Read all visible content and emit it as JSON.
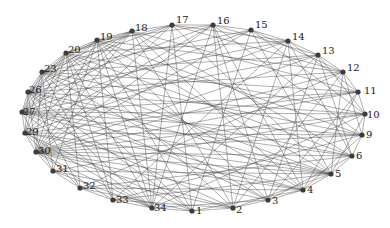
{
  "diagram": {
    "type": "circular-network-graph",
    "nodes": [
      {
        "id": "17",
        "x": 172,
        "y": 25,
        "lx": 4,
        "ly": -2
      },
      {
        "id": "16",
        "x": 213,
        "y": 25,
        "lx": 4,
        "ly": -1
      },
      {
        "id": "15",
        "x": 251,
        "y": 30,
        "lx": 4,
        "ly": -2
      },
      {
        "id": "14",
        "x": 288,
        "y": 41,
        "lx": 4,
        "ly": -1
      },
      {
        "id": "13",
        "x": 318,
        "y": 55,
        "lx": 4,
        "ly": -1
      },
      {
        "id": "12",
        "x": 343,
        "y": 72,
        "lx": 4,
        "ly": -1
      },
      {
        "id": "11",
        "x": 358,
        "y": 92,
        "lx": 6,
        "ly": 2
      },
      {
        "id": "10",
        "x": 365,
        "y": 114,
        "lx": 2,
        "ly": 4
      },
      {
        "id": "9",
        "x": 362,
        "y": 135,
        "lx": 4,
        "ly": 3
      },
      {
        "id": "6",
        "x": 352,
        "y": 156,
        "lx": 4,
        "ly": 3
      },
      {
        "id": "5",
        "x": 331,
        "y": 174,
        "lx": 4,
        "ly": 3
      },
      {
        "id": "4",
        "x": 303,
        "y": 190,
        "lx": 4,
        "ly": 3
      },
      {
        "id": "3",
        "x": 268,
        "y": 200,
        "lx": 4,
        "ly": 4
      },
      {
        "id": "2",
        "x": 233,
        "y": 208,
        "lx": 3,
        "ly": 5
      },
      {
        "id": "1",
        "x": 192,
        "y": 211,
        "lx": 4,
        "ly": 3
      },
      {
        "id": "34",
        "x": 152,
        "y": 208,
        "lx": 2,
        "ly": 3
      },
      {
        "id": "33",
        "x": 113,
        "y": 200,
        "lx": 3,
        "ly": 3
      },
      {
        "id": "32",
        "x": 80,
        "y": 188,
        "lx": 3,
        "ly": 1
      },
      {
        "id": "31",
        "x": 53,
        "y": 171,
        "lx": 3,
        "ly": 1
      },
      {
        "id": "30",
        "x": 36,
        "y": 152,
        "lx": 2,
        "ly": 2
      },
      {
        "id": "29",
        "x": 25,
        "y": 133,
        "lx": 1,
        "ly": 2
      },
      {
        "id": "27",
        "x": 22,
        "y": 112,
        "lx": 1,
        "ly": 3
      },
      {
        "id": "26",
        "x": 28,
        "y": 92,
        "lx": 1,
        "ly": 1
      },
      {
        "id": "23",
        "x": 42,
        "y": 72,
        "lx": 2,
        "ly": 0
      },
      {
        "id": "20",
        "x": 66,
        "y": 53,
        "lx": 2,
        "ly": 0
      },
      {
        "id": "19",
        "x": 97,
        "y": 40,
        "lx": 3,
        "ly": 0
      },
      {
        "id": "18",
        "x": 132,
        "y": 31,
        "lx": 3,
        "ly": 0
      }
    ],
    "edges": [
      [
        "17",
        "16"
      ],
      [
        "16",
        "15"
      ],
      [
        "15",
        "14"
      ],
      [
        "14",
        "13"
      ],
      [
        "13",
        "12"
      ],
      [
        "12",
        "11"
      ],
      [
        "11",
        "10"
      ],
      [
        "10",
        "9"
      ],
      [
        "9",
        "6"
      ],
      [
        "6",
        "5"
      ],
      [
        "5",
        "4"
      ],
      [
        "4",
        "3"
      ],
      [
        "3",
        "2"
      ],
      [
        "2",
        "1"
      ],
      [
        "1",
        "34"
      ],
      [
        "34",
        "33"
      ],
      [
        "33",
        "32"
      ],
      [
        "32",
        "31"
      ],
      [
        "31",
        "30"
      ],
      [
        "30",
        "29"
      ],
      [
        "29",
        "27"
      ],
      [
        "27",
        "26"
      ],
      [
        "26",
        "23"
      ],
      [
        "23",
        "20"
      ],
      [
        "20",
        "19"
      ],
      [
        "19",
        "18"
      ],
      [
        "18",
        "17"
      ],
      [
        "17",
        "14"
      ],
      [
        "17",
        "12"
      ],
      [
        "17",
        "5"
      ],
      [
        "17",
        "34"
      ],
      [
        "17",
        "30"
      ],
      [
        "17",
        "23"
      ],
      [
        "17",
        "20"
      ],
      [
        "17",
        "1"
      ],
      [
        "17",
        "27"
      ],
      [
        "16",
        "13"
      ],
      [
        "16",
        "4"
      ],
      [
        "16",
        "2"
      ],
      [
        "16",
        "34"
      ],
      [
        "16",
        "30"
      ],
      [
        "16",
        "26"
      ],
      [
        "16",
        "19"
      ],
      [
        "16",
        "9"
      ],
      [
        "16",
        "3"
      ],
      [
        "16",
        "29"
      ],
      [
        "15",
        "12"
      ],
      [
        "15",
        "10"
      ],
      [
        "15",
        "30"
      ],
      [
        "15",
        "23"
      ],
      [
        "15",
        "27"
      ],
      [
        "15",
        "5"
      ],
      [
        "15",
        "1"
      ],
      [
        "14",
        "11"
      ],
      [
        "14",
        "4"
      ],
      [
        "14",
        "2"
      ],
      [
        "14",
        "29"
      ],
      [
        "14",
        "20"
      ],
      [
        "14",
        "26"
      ],
      [
        "14",
        "6"
      ],
      [
        "14",
        "33"
      ],
      [
        "13",
        "10"
      ],
      [
        "13",
        "6"
      ],
      [
        "13",
        "3"
      ],
      [
        "13",
        "30"
      ],
      [
        "13",
        "23"
      ],
      [
        "13",
        "27"
      ],
      [
        "13",
        "34"
      ],
      [
        "12",
        "9"
      ],
      [
        "12",
        "5"
      ],
      [
        "12",
        "32"
      ],
      [
        "12",
        "26"
      ],
      [
        "12",
        "19"
      ],
      [
        "12",
        "30"
      ],
      [
        "12",
        "2"
      ],
      [
        "11",
        "30"
      ],
      [
        "11",
        "29"
      ],
      [
        "11",
        "23"
      ],
      [
        "11",
        "4"
      ],
      [
        "11",
        "3"
      ],
      [
        "11",
        "27"
      ],
      [
        "11",
        "18"
      ],
      [
        "10",
        "30"
      ],
      [
        "10",
        "27"
      ],
      [
        "10",
        "26"
      ],
      [
        "10",
        "20"
      ],
      [
        "10",
        "34"
      ],
      [
        "10",
        "5"
      ],
      [
        "10",
        "31"
      ],
      [
        "9",
        "30"
      ],
      [
        "9",
        "29"
      ],
      [
        "9",
        "23"
      ],
      [
        "9",
        "19"
      ],
      [
        "9",
        "33"
      ],
      [
        "9",
        "4"
      ],
      [
        "9",
        "27"
      ],
      [
        "6",
        "30"
      ],
      [
        "6",
        "27"
      ],
      [
        "6",
        "20"
      ],
      [
        "6",
        "18"
      ],
      [
        "6",
        "32"
      ],
      [
        "6",
        "3"
      ],
      [
        "6",
        "26"
      ],
      [
        "5",
        "30"
      ],
      [
        "5",
        "29"
      ],
      [
        "5",
        "23"
      ],
      [
        "5",
        "26"
      ],
      [
        "5",
        "19"
      ],
      [
        "5",
        "33"
      ],
      [
        "5",
        "2"
      ],
      [
        "5",
        "27"
      ],
      [
        "5",
        "31"
      ],
      [
        "4",
        "29"
      ],
      [
        "4",
        "27"
      ],
      [
        "4",
        "20"
      ],
      [
        "4",
        "18"
      ],
      [
        "4",
        "32"
      ],
      [
        "4",
        "1"
      ],
      [
        "4",
        "30"
      ],
      [
        "3",
        "30"
      ],
      [
        "3",
        "26"
      ],
      [
        "3",
        "19"
      ],
      [
        "3",
        "23"
      ],
      [
        "3",
        "34"
      ],
      [
        "2",
        "30"
      ],
      [
        "2",
        "27"
      ],
      [
        "2",
        "20"
      ],
      [
        "2",
        "18"
      ],
      [
        "2",
        "31"
      ],
      [
        "2",
        "33"
      ],
      [
        "1",
        "29"
      ],
      [
        "1",
        "23"
      ],
      [
        "1",
        "19"
      ],
      [
        "1",
        "26"
      ],
      [
        "1",
        "32"
      ],
      [
        "34",
        "18"
      ],
      [
        "34",
        "20"
      ],
      [
        "34",
        "26"
      ],
      [
        "34",
        "19"
      ],
      [
        "34",
        "31"
      ],
      [
        "34",
        "30"
      ],
      [
        "34",
        "29"
      ],
      [
        "34",
        "27"
      ],
      [
        "33",
        "23"
      ],
      [
        "33",
        "30"
      ],
      [
        "33",
        "19"
      ],
      [
        "33",
        "20"
      ],
      [
        "32",
        "29"
      ],
      [
        "32",
        "26"
      ],
      [
        "32",
        "20"
      ],
      [
        "31",
        "27"
      ],
      [
        "31",
        "23"
      ],
      [
        "31",
        "19"
      ],
      [
        "30",
        "26"
      ],
      [
        "30",
        "23"
      ],
      [
        "30",
        "20"
      ],
      [
        "30",
        "19"
      ],
      [
        "30",
        "18"
      ],
      [
        "29",
        "26"
      ],
      [
        "29",
        "23"
      ],
      [
        "29",
        "20"
      ],
      [
        "29",
        "18"
      ],
      [
        "27",
        "23"
      ],
      [
        "27",
        "20"
      ],
      [
        "27",
        "19"
      ],
      [
        "27",
        "18"
      ],
      [
        "26",
        "20"
      ],
      [
        "26",
        "19"
      ],
      [
        "26",
        "18"
      ],
      [
        "23",
        "19"
      ],
      [
        "23",
        "18"
      ],
      [
        "20",
        "18"
      ]
    ]
  }
}
